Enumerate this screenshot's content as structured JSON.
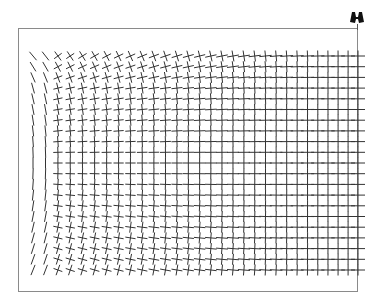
{
  "figure": {
    "type": "orientation-field",
    "colors": {
      "stroke": "#333333",
      "frame": "#8a8a8a",
      "background": "#ffffff",
      "icon": "#111111"
    },
    "frame": {
      "x": 18,
      "y": 28,
      "width": 340,
      "height": 264
    },
    "grid": {
      "columns": 30,
      "rows": 21,
      "x_start": 33,
      "x_end": 358,
      "y_start": 56,
      "y_end": 270,
      "column_compression": 0.12,
      "max_angle_deg": 22,
      "left_columns_single_stroke": 2
    },
    "icon": {
      "name": "binoculars-icon",
      "x": 349,
      "y": 10
    }
  }
}
